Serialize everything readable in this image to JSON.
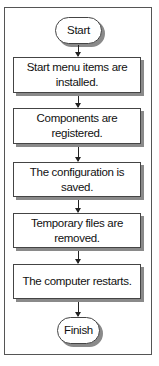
{
  "flowchart": {
    "start": "Start",
    "steps": [
      "Start menu items are installed.",
      "Components are registered.",
      "The configuration is saved.",
      "Temporary files are removed.",
      "The computer restarts."
    ],
    "finish": "Finish"
  }
}
